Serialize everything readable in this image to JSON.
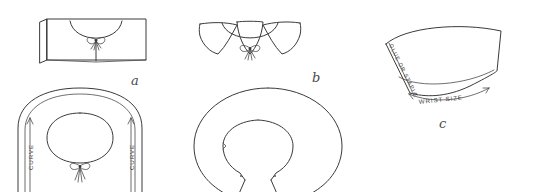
{
  "figure": {
    "style": "hand-drawn line art",
    "background_color": "#ffffff",
    "ink_color": "#3a3a3a"
  },
  "panels": [
    {
      "id": "a",
      "label": "a",
      "name": "rectangular-collar-front-view",
      "description": "Rectangular collar band with scooped neckline and bow tie at center front",
      "annotations": []
    },
    {
      "id": "b-top",
      "label": "b",
      "name": "flared-collar-front-view",
      "description": "Flared circular collar with bow tie at center front",
      "annotations": []
    },
    {
      "id": "a-pattern",
      "label": "",
      "name": "rectangular-collar-flat-pattern",
      "description": "Flat pattern piece for rectangular collar with inner neck opening and bow",
      "annotations": [
        {
          "text": "CURVE",
          "name": "curve-label-left",
          "arrow": "up"
        },
        {
          "text": "CURVE",
          "name": "curve-label-right",
          "arrow": "up"
        }
      ]
    },
    {
      "id": "b-pattern",
      "label": "",
      "name": "circular-collar-flat-pattern",
      "description": "Flat donut-shaped pattern piece for circular collar with split opening",
      "annotations": []
    },
    {
      "id": "c",
      "label": "c",
      "name": "cuff-fan-flat-pattern",
      "description": "Fan shaped cuff pattern piece with glue tab edge and wrist measurement",
      "annotations": [
        {
          "text": "GLUE OR STAPLE",
          "name": "glue-or-staple-label",
          "arrow": "none"
        },
        {
          "text": "WRIST SIZE",
          "name": "wrist-size-label",
          "arrow": "double"
        }
      ]
    }
  ],
  "labels": {
    "a": "a",
    "b": "b",
    "c": "c",
    "curve_left": "CURVE",
    "curve_right": "CURVE",
    "glue_or_staple": "GLUE OR STAPLE",
    "wrist_size": "WRIST SIZE"
  }
}
